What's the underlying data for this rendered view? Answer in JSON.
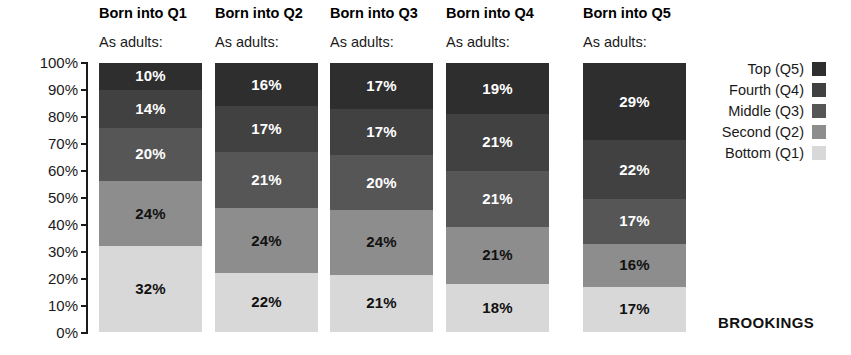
{
  "chart_data": {
    "type": "bar",
    "subtype": "stacked-bar-100-percent",
    "title": "",
    "xlabel": "",
    "ylabel": "",
    "ylim": [
      0,
      100
    ],
    "grid": false,
    "legend_position": "right",
    "categories": [
      "Born into Q1",
      "Born into Q2",
      "Born into Q3",
      "Born into Q4",
      "Born into Q5"
    ],
    "category_subtitle": "As adults:",
    "ytick_labels": [
      "100%",
      "90%",
      "80%",
      "70%",
      "60%",
      "50%",
      "40%",
      "30%",
      "20%",
      "10%",
      "0%"
    ],
    "ytick_values": [
      100,
      90,
      80,
      70,
      60,
      50,
      40,
      30,
      20,
      10,
      0
    ],
    "series": [
      {
        "name": "Top (Q5)",
        "color": "#2e2e2e",
        "label_color": "#ffffff",
        "values": [
          10,
          16,
          17,
          19,
          29
        ],
        "value_labels": [
          "10%",
          "16%",
          "17%",
          "19%",
          "29%"
        ]
      },
      {
        "name": "Fourth (Q4)",
        "color": "#414141",
        "label_color": "#ffffff",
        "values": [
          14,
          17,
          17,
          21,
          22
        ],
        "value_labels": [
          "14%",
          "17%",
          "17%",
          "21%",
          "22%"
        ]
      },
      {
        "name": "Middle (Q3)",
        "color": "#565656",
        "label_color": "#ffffff",
        "values": [
          20,
          21,
          20,
          21,
          17
        ],
        "value_labels": [
          "20%",
          "21%",
          "20%",
          "21%",
          "17%"
        ]
      },
      {
        "name": "Second (Q2)",
        "color": "#8d8d8d",
        "label_color": "#111111",
        "values": [
          24,
          24,
          24,
          21,
          16
        ],
        "value_labels": [
          "24%",
          "24%",
          "24%",
          "21%",
          "16%"
        ]
      },
      {
        "name": "Bottom (Q1)",
        "color": "#d8d8d8",
        "label_color": "#111111",
        "values": [
          32,
          22,
          21,
          18,
          17
        ],
        "value_labels": [
          "32%",
          "22%",
          "21%",
          "18%",
          "17%"
        ]
      }
    ],
    "legend_entries": [
      {
        "label": "Top (Q5)",
        "color": "#2e2e2e"
      },
      {
        "label": "Fourth (Q4)",
        "color": "#414141"
      },
      {
        "label": "Middle (Q3)",
        "color": "#565656"
      },
      {
        "label": "Second (Q2)",
        "color": "#8d8d8d"
      },
      {
        "label": "Bottom (Q1)",
        "color": "#d8d8d8"
      }
    ]
  },
  "brand": {
    "name": "BROOKINGS"
  },
  "layout": {
    "column_left_positions": [
      99,
      215,
      330,
      446,
      583
    ],
    "bar_width": 103,
    "bar_top": 63,
    "bar_height": 269
  }
}
